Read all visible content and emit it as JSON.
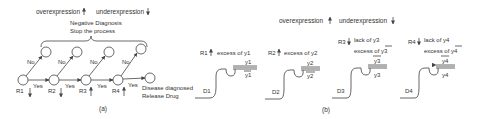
{
  "figure_a": {
    "legend": {
      "over": "overexpression",
      "under": "underexpression"
    },
    "negative_box": {
      "line1": "Negative Diagnosis",
      "line2": "Stop the process"
    },
    "nodes": [
      {
        "label": "R1",
        "dir": "↓"
      },
      {
        "label": "R2",
        "dir": "↓"
      },
      {
        "label": "R3",
        "dir": "↑"
      },
      {
        "label": "R4",
        "dir": "↑"
      }
    ],
    "edge_yes": "Yes",
    "edge_no": "No",
    "final": {
      "line1": "Disease diagnosed",
      "line2": "Release Drug"
    },
    "caption": "(a)"
  },
  "figure_b": {
    "legend": {
      "over": "overexpression",
      "under": "underexpression"
    },
    "gates": [
      {
        "id": "D1",
        "rule": "R1",
        "dir": "↑",
        "line1": "excess of y1",
        "line2": "",
        "top_strand": "y1",
        "bottom_strand": "y1̄",
        "top_overline": false,
        "bottom_overline": true
      },
      {
        "id": "D2",
        "rule": "R2",
        "dir": "↑",
        "line1": "excess of y2",
        "line2": "",
        "top_strand": "y2",
        "bottom_strand": "y2",
        "top_overline": false,
        "bottom_overline": true
      },
      {
        "id": "D3",
        "rule": "R3",
        "dir": "↓",
        "line1": "lack of y3",
        "line2": "excess of y3",
        "top_strand": "y3",
        "bottom_strand": "y3",
        "top_overline": true,
        "bottom_overline": false
      },
      {
        "id": "D4",
        "rule": "R4",
        "dir": "↓",
        "line1": "lack of y4",
        "line2": "excess of y4",
        "top_strand": "y4",
        "bottom_strand": "y4",
        "top_overline": true,
        "bottom_overline": false
      }
    ],
    "caption": "(b)"
  }
}
